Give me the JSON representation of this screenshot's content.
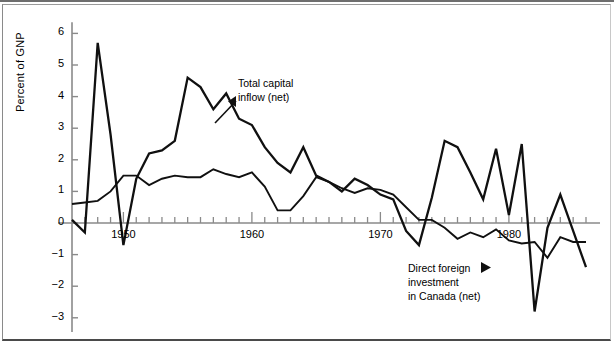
{
  "figure": {
    "background": "#ffffff",
    "line_color": "#101010",
    "axis_color": "#8a8a8a"
  },
  "chart_data": {
    "type": "line",
    "title": "",
    "xlabel": "",
    "ylabel": "Percent of GNP",
    "xlim": [
      1946,
      1986
    ],
    "ylim": [
      -3.4,
      6.4
    ],
    "grid": false,
    "legend": "annotations",
    "yticks": [
      6,
      5,
      4,
      3,
      2,
      1,
      0,
      -1,
      -2,
      -3
    ],
    "ytick_labels": [
      "6",
      "5",
      "4",
      "3",
      "2",
      "1",
      "0",
      "−1",
      "−2",
      "−3"
    ],
    "xticks": [
      1947,
      1948,
      1949,
      1950,
      1951,
      1952,
      1953,
      1954,
      1955,
      1956,
      1957,
      1958,
      1959,
      1960,
      1961,
      1962,
      1963,
      1964,
      1965,
      1966,
      1967,
      1968,
      1969,
      1970,
      1971,
      1972,
      1973,
      1974,
      1975,
      1976,
      1977,
      1978,
      1979,
      1980,
      1981,
      1982,
      1983,
      1984,
      1985,
      1986
    ],
    "xtick_labels": [
      "1950",
      "1960",
      "1970",
      "1980"
    ],
    "xtick_label_years": [
      1950,
      1960,
      1970,
      1980
    ],
    "series": [
      {
        "name": "Total capital inflow (net)",
        "x": [
          1946,
          1947,
          1948,
          1949,
          1950,
          1951,
          1952,
          1953,
          1954,
          1955,
          1956,
          1957,
          1958,
          1959,
          1960,
          1961,
          1962,
          1963,
          1964,
          1965,
          1966,
          1967,
          1968,
          1969,
          1970,
          1971,
          1972,
          1973,
          1974,
          1975,
          1976,
          1977,
          1978,
          1979,
          1980,
          1981,
          1982,
          1983,
          1984,
          1985,
          1986
        ],
        "values": [
          0.1,
          -0.3,
          5.7,
          2.8,
          -0.7,
          1.4,
          2.2,
          2.3,
          2.6,
          4.6,
          4.3,
          3.6,
          4.1,
          3.3,
          3.1,
          2.4,
          1.9,
          1.6,
          2.4,
          1.5,
          1.3,
          1.0,
          1.4,
          1.2,
          0.9,
          0.75,
          -0.25,
          -0.7,
          0.8,
          2.6,
          2.4,
          1.6,
          0.75,
          2.35,
          0.25,
          2.5,
          -2.8,
          -0.15,
          0.9,
          -0.25,
          -1.4
        ]
      },
      {
        "name": "Direct foreign investment in Canada (net)",
        "x": [
          1946,
          1947,
          1948,
          1949,
          1950,
          1951,
          1952,
          1953,
          1954,
          1955,
          1956,
          1957,
          1958,
          1959,
          1960,
          1961,
          1962,
          1963,
          1964,
          1965,
          1966,
          1967,
          1968,
          1969,
          1970,
          1971,
          1972,
          1973,
          1974,
          1975,
          1976,
          1977,
          1978,
          1979,
          1980,
          1981,
          1982,
          1983,
          1984,
          1985,
          1986
        ],
        "values": [
          0.6,
          0.65,
          0.7,
          1.0,
          1.5,
          1.5,
          1.2,
          1.4,
          1.5,
          1.45,
          1.45,
          1.7,
          1.55,
          1.45,
          1.6,
          1.15,
          0.4,
          0.4,
          0.85,
          1.45,
          1.3,
          1.1,
          0.95,
          1.1,
          1.05,
          0.9,
          0.5,
          0.1,
          0.1,
          -0.15,
          -0.5,
          -0.3,
          -0.45,
          -0.2,
          -0.55,
          -0.65,
          -0.6,
          -1.1,
          -0.45,
          -0.6,
          -0.6
        ]
      }
    ],
    "annotations": [
      {
        "name": "total-capital-inflow",
        "lines": [
          "Total capital",
          "inflow (net)"
        ],
        "arrow": "left-triangle"
      },
      {
        "name": "direct-foreign-investment",
        "lines": [
          "Direct foreign",
          "investment",
          "in Canada (net)"
        ],
        "arrow": "right-triangle"
      }
    ]
  }
}
